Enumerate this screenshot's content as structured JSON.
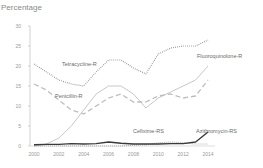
{
  "chart_data": {
    "type": "line",
    "title": "",
    "xlabel": "",
    "ylabel": "Percentage",
    "ylim": [
      0,
      30
    ],
    "yticks": [
      0,
      5,
      10,
      15,
      20,
      25,
      30
    ],
    "xticks": [
      2000,
      2002,
      2004,
      2006,
      2008,
      2010,
      2012,
      2014
    ],
    "grid": false,
    "legend": "inline labels",
    "x": [
      2000,
      2001,
      2002,
      2003,
      2004,
      2005,
      2006,
      2007,
      2008,
      2009,
      2010,
      2011,
      2012,
      2013,
      2014
    ],
    "series": [
      {
        "name": "Tetracycline-R",
        "style": "dotted",
        "color": "#8c8c8c",
        "values": [
          20.5,
          18.5,
          16.5,
          15.5,
          15,
          18.5,
          21.5,
          21.5,
          19.5,
          18,
          23,
          24.5,
          25,
          25,
          26.5
        ]
      },
      {
        "name": "Fluoroquinolone-R",
        "style": "solid",
        "color": "#c8c8c8",
        "values": [
          0,
          0.5,
          2,
          5,
          9,
          13,
          15,
          15,
          13,
          9.5,
          12,
          13.5,
          15,
          16.5,
          20
        ]
      },
      {
        "name": "Penicillin-R",
        "style": "dashed",
        "color": "#bdbdbd",
        "values": [
          15.5,
          14,
          11.5,
          9,
          8,
          10,
          12,
          13,
          11,
          11,
          12.5,
          13,
          12,
          12.5,
          16.5
        ]
      },
      {
        "name": "Cefixime-RS",
        "style": "dotted",
        "color": "#a0a0a0",
        "values": [
          0,
          0,
          0,
          0,
          0,
          0,
          0,
          0,
          0.2,
          0.3,
          0.8,
          1,
          0.8,
          0.5,
          0.5
        ]
      },
      {
        "name": "Azithromycin-RS",
        "style": "solid",
        "color": "#3a3a3a",
        "values": [
          0.3,
          0.4,
          0.4,
          0.6,
          0.5,
          0.6,
          1,
          0.7,
          0.5,
          0.5,
          0.5,
          0.6,
          0.6,
          1,
          3.5
        ]
      }
    ]
  },
  "labels": {
    "ylabel": "Percentage",
    "tetracycline": "Tetracycline-R",
    "fluoroquinolone": "Fluoroquinolone-R",
    "penicillin": "Penicillin-R",
    "cefixime": "Cefixime-RS",
    "azithromycin": "Azithromycin-RS"
  }
}
